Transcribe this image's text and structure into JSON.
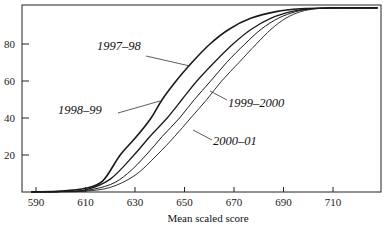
{
  "chart_data": {
    "type": "line",
    "title": "",
    "xlabel": "Mean scaled score",
    "ylabel": "",
    "xlim": [
      586,
      730
    ],
    "ylim": [
      0,
      100
    ],
    "x_ticks": [
      590,
      610,
      630,
      650,
      670,
      690,
      710
    ],
    "y_ticks": [
      20,
      40,
      60,
      80
    ],
    "grid": false,
    "legend": "inline labels with leader lines",
    "series": [
      {
        "name": "1997–98",
        "points": [
          [
            588,
            0
          ],
          [
            600,
            0.5
          ],
          [
            610,
            2
          ],
          [
            617,
            6
          ],
          [
            624,
            20
          ],
          [
            630,
            29
          ],
          [
            636.5,
            40
          ],
          [
            641,
            50
          ],
          [
            646.6,
            60
          ],
          [
            653,
            70
          ],
          [
            660.3,
            80
          ],
          [
            668,
            88
          ],
          [
            677,
            94
          ],
          [
            687,
            97.5
          ],
          [
            697,
            99
          ],
          [
            710,
            99.5
          ],
          [
            728,
            99.5
          ]
        ]
      },
      {
        "name": "1998–99",
        "points": [
          [
            588,
            0
          ],
          [
            600,
            0.3
          ],
          [
            610,
            1.2
          ],
          [
            620,
            7
          ],
          [
            629.6,
            20
          ],
          [
            636,
            30
          ],
          [
            643,
            40
          ],
          [
            649,
            50
          ],
          [
            655,
            60
          ],
          [
            662,
            70
          ],
          [
            669.6,
            80
          ],
          [
            677,
            88
          ],
          [
            685,
            94
          ],
          [
            693,
            97.5
          ],
          [
            700,
            99
          ],
          [
            710,
            99.5
          ],
          [
            728,
            99.5
          ]
        ]
      },
      {
        "name": "1999–2000",
        "points": [
          [
            588,
            0
          ],
          [
            600,
            0.2
          ],
          [
            610,
            0.8
          ],
          [
            620,
            4
          ],
          [
            627,
            10
          ],
          [
            634.5,
            20
          ],
          [
            641,
            30
          ],
          [
            648,
            40
          ],
          [
            654,
            50
          ],
          [
            660.6,
            60
          ],
          [
            667,
            70
          ],
          [
            674.4,
            80
          ],
          [
            681,
            88
          ],
          [
            688,
            94
          ],
          [
            695,
            97.5
          ],
          [
            701,
            99
          ],
          [
            710,
            99.5
          ],
          [
            728,
            99.5
          ]
        ]
      },
      {
        "name": "2000–01",
        "points": [
          [
            588,
            0
          ],
          [
            600,
            0.1
          ],
          [
            610,
            0.5
          ],
          [
            620,
            2.5
          ],
          [
            630,
            9
          ],
          [
            638.9,
            20
          ],
          [
            646,
            30
          ],
          [
            652.5,
            40
          ],
          [
            659,
            50
          ],
          [
            665,
            60
          ],
          [
            672,
            70
          ],
          [
            679,
            80
          ],
          [
            685,
            88
          ],
          [
            691,
            94
          ],
          [
            697,
            97.5
          ],
          [
            703,
            99
          ],
          [
            710,
            99.5
          ],
          [
            728,
            99.5
          ]
        ]
      }
    ],
    "annotations": [
      {
        "text": "1997–98",
        "label_x": 97,
        "label_y": 50,
        "leader": [
          [
            146,
            56
          ],
          [
            190,
            66
          ]
        ]
      },
      {
        "text": "1998–99",
        "label_x": 58,
        "label_y": 114,
        "leader": [
          [
            118,
            113
          ],
          [
            160,
            101
          ]
        ]
      },
      {
        "text": "1999–2000",
        "label_x": 228,
        "label_y": 107,
        "leader": [
          [
            227,
            100
          ],
          [
            210,
            91
          ]
        ]
      },
      {
        "text": "2000–01",
        "label_x": 213,
        "label_y": 145,
        "leader": [
          [
            212,
            140
          ],
          [
            193,
            130
          ]
        ]
      }
    ]
  }
}
